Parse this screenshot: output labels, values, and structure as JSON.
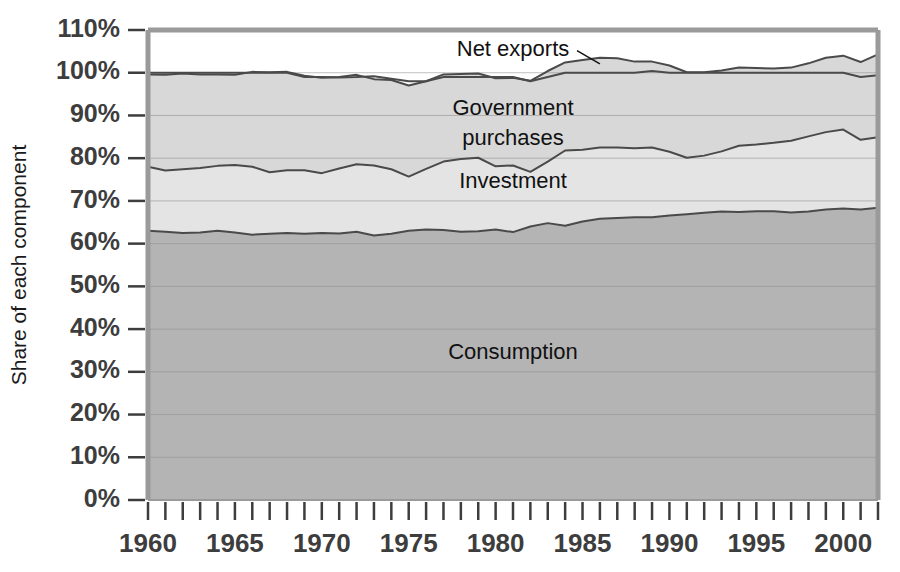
{
  "chart_data": {
    "type": "area",
    "title": "",
    "subtitle": "",
    "xlabel": "",
    "ylabel": "Share of each component",
    "ylim": [
      0,
      110
    ],
    "xlim": [
      1960,
      2002
    ],
    "grid": true,
    "stacked": true,
    "legend_position": "inline-annotations",
    "ytick_labels": [
      "0%",
      "10%",
      "20%",
      "30%",
      "40%",
      "50%",
      "60%",
      "70%",
      "80%",
      "90%",
      "100%",
      "110%"
    ],
    "ytick_values": [
      0,
      10,
      20,
      30,
      40,
      50,
      60,
      70,
      80,
      90,
      100,
      110
    ],
    "xtick_labels": [
      "1960",
      "1965",
      "1970",
      "1975",
      "1980",
      "1985",
      "1990",
      "1995",
      "2000"
    ],
    "xtick_values": [
      1960,
      1965,
      1970,
      1975,
      1980,
      1985,
      1990,
      1995,
      2000
    ],
    "minor_xticks_every": 1,
    "x": [
      1960,
      1961,
      1962,
      1963,
      1964,
      1965,
      1966,
      1967,
      1968,
      1969,
      1970,
      1971,
      1972,
      1973,
      1974,
      1975,
      1976,
      1977,
      1978,
      1979,
      1980,
      1981,
      1982,
      1983,
      1984,
      1985,
      1986,
      1987,
      1988,
      1989,
      1990,
      1991,
      1992,
      1993,
      1994,
      1995,
      1996,
      1997,
      1998,
      1999,
      2000,
      2001,
      2002
    ],
    "series": [
      {
        "name": "Consumption",
        "color": "#b4b4b4",
        "label_x": 1981,
        "label_y": 33,
        "values": [
          63.0,
          62.8,
          62.5,
          62.6,
          63.0,
          62.6,
          62.1,
          62.3,
          62.5,
          62.3,
          62.5,
          62.4,
          62.8,
          61.9,
          62.3,
          63.0,
          63.3,
          63.2,
          62.8,
          62.9,
          63.3,
          62.7,
          64.0,
          64.8,
          64.2,
          65.2,
          65.8,
          66.0,
          66.2,
          66.2,
          66.6,
          66.9,
          67.2,
          67.5,
          67.4,
          67.6,
          67.6,
          67.3,
          67.5,
          68.0,
          68.2,
          68.0,
          68.4
        ]
      },
      {
        "name": "Investment",
        "color": "#e4e4e4",
        "label_x": 1981,
        "label_y": 73,
        "values": [
          15.0,
          14.3,
          14.9,
          15.1,
          15.2,
          15.8,
          15.9,
          14.4,
          14.7,
          14.9,
          14.0,
          15.2,
          15.8,
          16.4,
          15.1,
          12.7,
          14.2,
          16.0,
          17.0,
          17.2,
          14.8,
          15.6,
          12.8,
          14.4,
          17.6,
          16.8,
          16.7,
          16.5,
          16.1,
          16.3,
          14.9,
          13.2,
          13.4,
          14.1,
          15.5,
          15.6,
          16.0,
          16.8,
          17.6,
          18.1,
          18.5,
          16.3,
          16.5
        ]
      },
      {
        "name": "Government purchases",
        "color": "#d8d8d8",
        "label_x": 1981,
        "label_y": 90,
        "values": [
          21.6,
          22.4,
          22.4,
          21.9,
          21.4,
          21.1,
          22.2,
          23.4,
          23.0,
          22.1,
          22.3,
          21.4,
          20.9,
          20.2,
          20.9,
          21.3,
          20.5,
          20.4,
          19.9,
          19.7,
          20.6,
          20.5,
          21.3,
          21.2,
          20.6,
          21.0,
          21.0,
          20.9,
          20.3,
          20.1,
          20.2,
          20.0,
          19.5,
          18.9,
          18.3,
          17.9,
          17.4,
          17.1,
          17.1,
          17.4,
          17.3,
          18.2,
          19.4
        ]
      },
      {
        "name": "Net exports",
        "color": "#ffffff",
        "label_x": 1981,
        "label_y": 104,
        "values": [
          0.4,
          0.5,
          0.2,
          0.4,
          0.4,
          0.5,
          -0.2,
          -0.1,
          -0.2,
          -0.3,
          0.2,
          -0.1,
          -0.5,
          0.7,
          0.3,
          1.0,
          0.0,
          -0.6,
          -0.7,
          -0.8,
          0.3,
          0.2,
          -0.1,
          -1.4,
          -2.4,
          -3.0,
          -3.5,
          -3.4,
          -2.6,
          -2.2,
          -1.7,
          -0.1,
          -0.1,
          -0.5,
          -1.2,
          -1.1,
          -1.0,
          -1.2,
          -2.2,
          -3.5,
          -4.0,
          -3.5,
          -4.9
        ]
      }
    ],
    "cumulative_totals": [
      99.5,
      99.5,
      99.4,
      99.6,
      99.7,
      99.7,
      99.6,
      99.7,
      99.8,
      99.7,
      99.8,
      99.8,
      99.9,
      99.8,
      99.3,
      99.5,
      100.4,
      100.8,
      101.1,
      101.2,
      101.2,
      101.4,
      101.4,
      102.3,
      102.8,
      102.9,
      103.0,
      102.8,
      102.4,
      101.8,
      101.1,
      100.9,
      101.1,
      101.9,
      102.5,
      102.8,
      102.9,
      103.2,
      103.9,
      104.6,
      105.1,
      104.0,
      105.2
    ]
  },
  "axis": {
    "y_axis_title": "Share of each component"
  },
  "annotations": {
    "net_exports_label": "Net exports",
    "government_label_line1": "Government",
    "government_label_line2": "purchases",
    "investment_label": "Investment",
    "consumption_label": "Consumption"
  },
  "colors": {
    "consumption": "#b4b4b4",
    "investment": "#e4e4e4",
    "government": "#d8d8d8",
    "net_exports": "#ffffff",
    "line": "#4a4a4a",
    "axis": "#9a9a9a",
    "grid": "#8f8f8f",
    "text": "#3d3d3d"
  }
}
